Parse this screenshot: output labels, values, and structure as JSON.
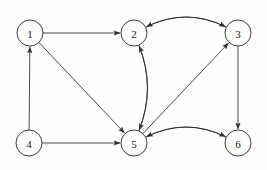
{
  "figure": {
    "name": "directed-graph",
    "background_color": "#fdfdfb",
    "stroke_color": "#2b2b2b",
    "label_color": "#161616",
    "width": 267,
    "height": 170
  },
  "graph": {
    "type": "directed-graph",
    "node_radius": 13,
    "nodes": [
      {
        "id": "1",
        "label": "1",
        "cx": 30,
        "cy": 33
      },
      {
        "id": "2",
        "label": "2",
        "cx": 134,
        "cy": 33
      },
      {
        "id": "3",
        "label": "3",
        "cx": 238,
        "cy": 33
      },
      {
        "id": "4",
        "label": "4",
        "cx": 29,
        "cy": 143
      },
      {
        "id": "5",
        "label": "5",
        "cx": 134,
        "cy": 143
      },
      {
        "id": "6",
        "label": "6",
        "cx": 238,
        "cy": 143
      }
    ],
    "edges": [
      {
        "from": "1",
        "to": "2",
        "shape": "straight",
        "directed": true
      },
      {
        "from": "1",
        "to": "5",
        "shape": "straight",
        "directed": true
      },
      {
        "from": "4",
        "to": "1",
        "shape": "straight",
        "directed": true
      },
      {
        "from": "4",
        "to": "5",
        "shape": "straight",
        "directed": true
      },
      {
        "from": "2",
        "to": "3",
        "shape": "curve-up",
        "directed": true
      },
      {
        "from": "3",
        "to": "2",
        "shape": "curve-down",
        "directed": true
      },
      {
        "from": "2",
        "to": "5",
        "shape": "curve-left",
        "directed": true
      },
      {
        "from": "5",
        "to": "2",
        "shape": "curve-right",
        "directed": true
      },
      {
        "from": "5",
        "to": "3",
        "shape": "straight",
        "directed": true
      },
      {
        "from": "3",
        "to": "6",
        "shape": "straight",
        "directed": true
      },
      {
        "from": "5",
        "to": "6",
        "shape": "curve-up",
        "directed": true
      },
      {
        "from": "6",
        "to": "5",
        "shape": "curve-down",
        "directed": true
      }
    ]
  }
}
